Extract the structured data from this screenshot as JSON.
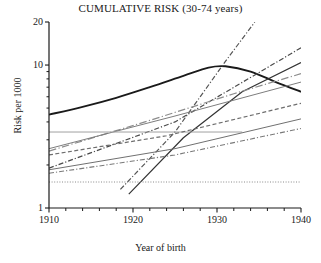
{
  "chart_data": {
    "type": "line",
    "title": "CUMULATIVE RISK (30-74 years)",
    "xlabel": "Year of birth",
    "ylabel": "Risk per 1000",
    "xlim": [
      1910,
      1940
    ],
    "ylim": [
      1,
      20
    ],
    "yscale": "log",
    "grid": false,
    "legend": "none",
    "x_ticks_major": [
      1910,
      1920,
      1930,
      1940
    ],
    "x_tick_labels": [
      "1910",
      "1920",
      "1930",
      "1940"
    ],
    "x_minor_tick_step": 2,
    "y_ticks_major": [
      1,
      10,
      20
    ],
    "y_tick_labels": [
      "1",
      "10",
      "20"
    ],
    "y_minor_ticks": [
      2,
      3,
      4,
      5,
      6,
      7,
      8,
      9
    ],
    "series": [
      {
        "name": "thick-peak-curve",
        "style": "solid",
        "width": 1.9,
        "color": "#1a1a1a",
        "x": [
          1910,
          1914,
          1918,
          1922,
          1926,
          1929,
          1931,
          1934,
          1937,
          1940
        ],
        "y": [
          4.5,
          5.1,
          5.9,
          7.0,
          8.4,
          9.6,
          9.8,
          9.0,
          7.6,
          6.5
        ]
      },
      {
        "name": "steep-dashdot-upper",
        "style": "dashdot",
        "width": 1.2,
        "color": "#555555",
        "x": [
          1918.5,
          1925,
          1931,
          1934.5
        ],
        "y": [
          1.35,
          3.4,
          10.6,
          20.0
        ]
      },
      {
        "name": "rising-dashdot-right",
        "style": "dashdot",
        "width": 1.2,
        "color": "#4a4a4a",
        "x": [
          1910,
          1925,
          1940
        ],
        "y": [
          1.9,
          4.0,
          13.2
        ]
      },
      {
        "name": "steep-solid-dark",
        "style": "solid",
        "width": 1.2,
        "color": "#333333",
        "x": [
          1919.5,
          1926,
          1933,
          1940
        ],
        "y": [
          1.25,
          3.1,
          6.5,
          10.4
        ]
      },
      {
        "name": "grey-rising-long-dashdot",
        "style": "longdashdot",
        "width": 1.2,
        "color": "#8c8c8c",
        "x": [
          1910,
          1922,
          1932,
          1940
        ],
        "y": [
          2.5,
          4.1,
          6.3,
          8.7
        ]
      },
      {
        "name": "grey-solid-rising",
        "style": "solid",
        "width": 1.0,
        "color": "#7d7d7d",
        "x": [
          1910,
          1925,
          1940
        ],
        "y": [
          2.6,
          4.4,
          7.6
        ]
      },
      {
        "name": "grey-solid-flat-left",
        "style": "solid",
        "width": 1.0,
        "color": "#a0a0a0",
        "x": [
          1910,
          1922,
          1933
        ],
        "y": [
          3.4,
          3.4,
          3.4
        ]
      },
      {
        "name": "dashed-mid-rising",
        "style": "dashed",
        "width": 1.2,
        "color": "#6e6e6e",
        "x": [
          1910,
          1924,
          1940
        ],
        "y": [
          2.35,
          3.2,
          5.4
        ]
      },
      {
        "name": "solid-lower-rising",
        "style": "solid",
        "width": 1.0,
        "color": "#707070",
        "x": [
          1910,
          1925,
          1940
        ],
        "y": [
          1.85,
          2.6,
          4.2
        ]
      },
      {
        "name": "dashdot-lowest-rising",
        "style": "dashdot",
        "width": 1.1,
        "color": "#7a7a7a",
        "x": [
          1910,
          1925,
          1940
        ],
        "y": [
          1.75,
          2.35,
          3.6
        ]
      },
      {
        "name": "dotted-flat-baseline",
        "style": "dotted",
        "width": 1.0,
        "color": "#8a8a8a",
        "x": [
          1910,
          1925,
          1940
        ],
        "y": [
          1.52,
          1.52,
          1.52
        ]
      }
    ]
  }
}
